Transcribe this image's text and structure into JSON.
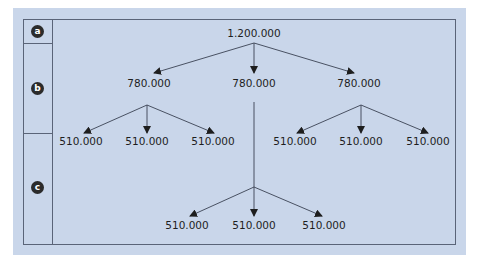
{
  "colors": {
    "panel_background": "#c9d6ea",
    "border": "#5a6478",
    "badge_background": "#2b2b2b",
    "badge_text": "#ffffff",
    "text": "#1e1e1e"
  },
  "rows": [
    {
      "label": "a"
    },
    {
      "label": "b"
    },
    {
      "label": "c"
    }
  ],
  "tree": {
    "root": {
      "value": "1.200.000"
    },
    "level_b": [
      {
        "value": "780.000",
        "children": [
          "510.000",
          "510.000",
          "510.000"
        ]
      },
      {
        "value": "780.000",
        "children": [
          "510.000",
          "510.000",
          "510.000"
        ]
      },
      {
        "value": "780.000",
        "children": [
          "510.000",
          "510.000",
          "510.000"
        ]
      }
    ]
  }
}
